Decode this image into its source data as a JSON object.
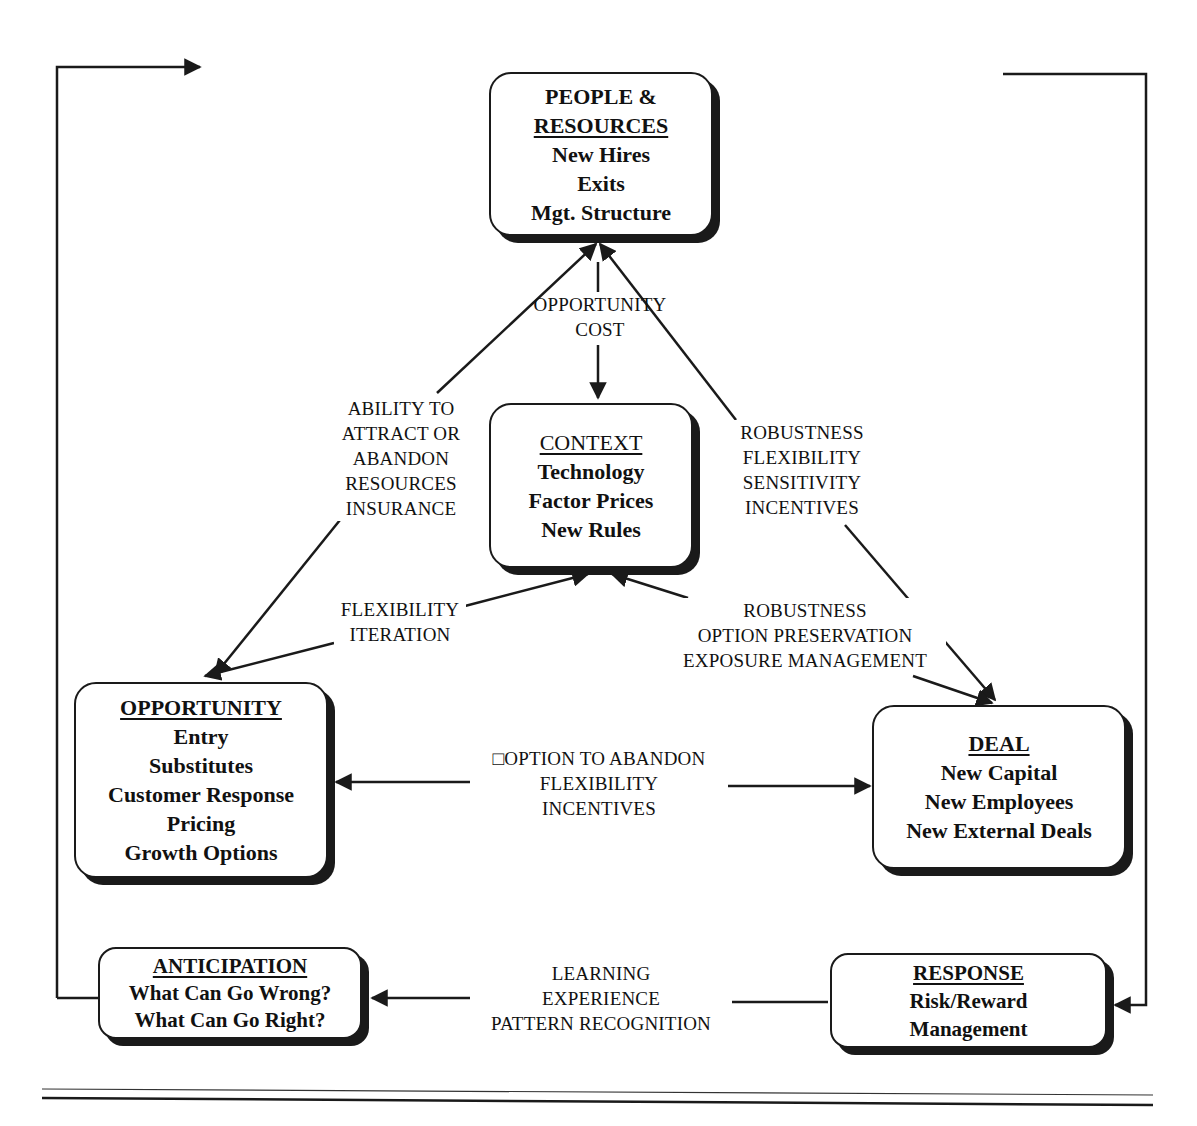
{
  "diagram": {
    "nodes": {
      "people": {
        "title_line1": "PEOPLE &",
        "title_line2": "RESOURCES",
        "items": [
          "New Hires",
          "Exits",
          "Mgt. Structure"
        ]
      },
      "context": {
        "title": "CONTEXT",
        "items": [
          "Technology",
          "Factor Prices",
          "New Rules"
        ]
      },
      "opportunity": {
        "title": "OPPORTUNITY",
        "items": [
          "Entry",
          "Substitutes",
          "Customer Response",
          "Pricing",
          "Growth Options"
        ]
      },
      "deal": {
        "title": "DEAL",
        "items": [
          "New Capital",
          "New Employees",
          "New External Deals"
        ]
      },
      "anticipation": {
        "title": "ANTICIPATION",
        "items": [
          "What Can Go Wrong?",
          "What Can Go Right?"
        ]
      },
      "response": {
        "title": "RESPONSE",
        "items": [
          "Risk/Reward",
          "Management"
        ]
      }
    },
    "edges": {
      "people_context": [
        "OPPORTUNITY",
        "COST"
      ],
      "people_opportunity": [
        "ABILITY TO",
        "ATTRACT OR",
        "ABANDON",
        "RESOURCES",
        "INSURANCE"
      ],
      "people_deal": [
        "ROBUSTNESS",
        "FLEXIBILITY",
        "SENSITIVITY",
        "INCENTIVES"
      ],
      "context_opportunity": [
        "FLEXIBILITY",
        "ITERATION"
      ],
      "context_deal": [
        "ROBUSTNESS",
        "OPTION PRESERVATION",
        "EXPOSURE MANAGEMENT"
      ],
      "opportunity_deal": [
        "□OPTION TO ABANDON",
        "FLEXIBILITY",
        "INCENTIVES"
      ],
      "response_anticipation": [
        "LEARNING",
        "EXPERIENCE",
        "PATTERN RECOGNITION"
      ]
    },
    "colors": {
      "ink": "#1a1a1a",
      "background": "#ffffff"
    }
  }
}
